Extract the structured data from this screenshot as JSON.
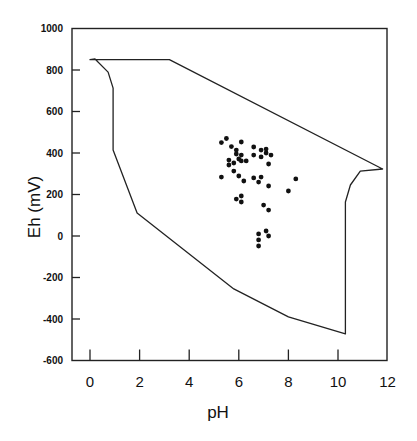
{
  "chart_data": {
    "type": "scatter",
    "title": "",
    "xlabel": "pH",
    "ylabel": "Eh (mV)",
    "xlim": [
      -0.7,
      12
    ],
    "ylim": [
      -600,
      1000
    ],
    "xticks": [
      0,
      2,
      4,
      6,
      8,
      10,
      12
    ],
    "yticks": [
      1000,
      800,
      600,
      400,
      200,
      0,
      -200,
      -400,
      -600
    ],
    "grid": false,
    "legend": null,
    "boundary_polygon": {
      "name": "Natural water Eh-pH field",
      "points": [
        [
          0.0,
          850
        ],
        [
          3.2,
          850
        ],
        [
          11.8,
          323
        ],
        [
          10.9,
          313
        ],
        [
          10.5,
          246
        ],
        [
          10.3,
          164
        ],
        [
          10.3,
          -472
        ],
        [
          8.0,
          -390
        ],
        [
          5.8,
          -255
        ],
        [
          1.9,
          111
        ],
        [
          0.93,
          414
        ],
        [
          0.93,
          713
        ],
        [
          0.73,
          790
        ],
        [
          0.2,
          853
        ]
      ]
    },
    "series": [
      {
        "name": "samples",
        "marker": "filled-circle",
        "points": [
          [
            5.3,
            450
          ],
          [
            5.5,
            470
          ],
          [
            5.7,
            431
          ],
          [
            5.9,
            414
          ],
          [
            6.1,
            453
          ],
          [
            5.9,
            395
          ],
          [
            6.1,
            390
          ],
          [
            6.0,
            371
          ],
          [
            6.1,
            362
          ],
          [
            6.3,
            362
          ],
          [
            5.6,
            366
          ],
          [
            5.8,
            352
          ],
          [
            5.6,
            342
          ],
          [
            6.6,
            429
          ],
          [
            6.6,
            390
          ],
          [
            6.9,
            414
          ],
          [
            7.1,
            419
          ],
          [
            7.1,
            400
          ],
          [
            7.3,
            390
          ],
          [
            6.9,
            381
          ],
          [
            7.2,
            347
          ],
          [
            5.8,
            313
          ],
          [
            5.3,
            284
          ],
          [
            6.0,
            289
          ],
          [
            6.2,
            265
          ],
          [
            6.6,
            280
          ],
          [
            6.9,
            284
          ],
          [
            6.8,
            260
          ],
          [
            7.2,
            241
          ],
          [
            8.3,
            275
          ],
          [
            8.0,
            217
          ],
          [
            6.1,
            193
          ],
          [
            5.9,
            178
          ],
          [
            6.1,
            164
          ],
          [
            7.0,
            149
          ],
          [
            7.2,
            125
          ],
          [
            7.1,
            24
          ],
          [
            7.2,
            0
          ],
          [
            6.8,
            10
          ],
          [
            6.8,
            -19
          ],
          [
            6.8,
            -48
          ]
        ]
      }
    ],
    "axis_pixels": {
      "x0_px": 90,
      "px_per_ph": 24.8,
      "y0_px": 236,
      "px_per_mv": 0.2075
    }
  }
}
